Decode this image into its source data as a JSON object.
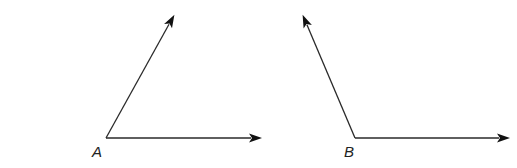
{
  "figure": {
    "angles": [
      {
        "label": "A",
        "rays": [
          {
            "name": "upper",
            "direction_deg": 61
          },
          {
            "name": "horizontal",
            "direction_deg": 0
          }
        ]
      },
      {
        "label": "B",
        "rays": [
          {
            "name": "upper",
            "direction_deg": 113
          },
          {
            "name": "horizontal",
            "direction_deg": 0
          }
        ]
      }
    ]
  }
}
